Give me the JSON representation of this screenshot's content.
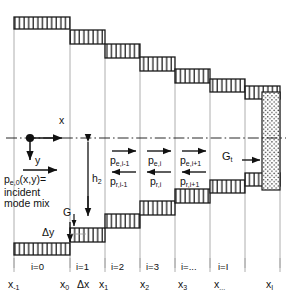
{
  "figure": {
    "type": "staircase-waveguide-discretization-diagram",
    "axis": {
      "x_label": "x",
      "y_label": "y",
      "origin_marker": "dot"
    },
    "incident": {
      "line1_main": "p",
      "line1_sub": "e,0",
      "line1_rest": "(x,y)=",
      "line2": "incident",
      "line3": "mode mix"
    },
    "dimensions": {
      "h2_main": "h",
      "h2_sub": "2",
      "gap_G": "G",
      "delta_y": "Δy",
      "delta_x": "Δx",
      "G_t_main": "G",
      "G_t_sub": "t"
    },
    "mode_arrows": [
      {
        "forward_main": "p",
        "forward_sub": "e,i-1",
        "reverse_main": "p",
        "reverse_sub": "r,i-1"
      },
      {
        "forward_main": "p",
        "forward_sub": "e,i",
        "reverse_main": "p",
        "reverse_sub": "r,i"
      },
      {
        "forward_main": "p",
        "forward_sub": "e,i+1",
        "reverse_main": "p",
        "reverse_sub": "r,i+1"
      }
    ],
    "cell_labels": [
      "i=0",
      "i=1",
      "i=2",
      "i=3",
      "i=...",
      "i=I"
    ],
    "x_ticks": [
      {
        "main": "x",
        "sub": "-1"
      },
      {
        "main": "x",
        "sub": "0"
      },
      {
        "main": "x",
        "sub": "1"
      },
      {
        "main": "x",
        "sub": "2"
      },
      {
        "main": "x",
        "sub": "3"
      },
      {
        "main": "x",
        "sub": "..."
      },
      {
        "main": "x",
        "sub": "I"
      }
    ],
    "colors": {
      "ink": "#111111",
      "hatch": "#1a1a1a",
      "grid": "#9a9a9a",
      "stipple": "#333333",
      "background": "#ffffff"
    }
  }
}
